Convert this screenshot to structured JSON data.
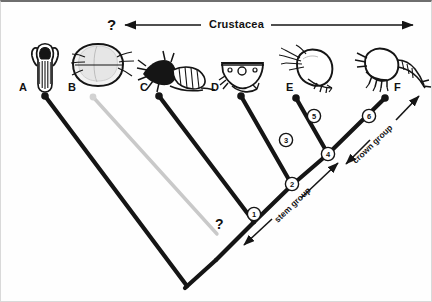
{
  "figure": {
    "title_label": "Crustacea",
    "uncertainty_marks": [
      {
        "id": "top-question",
        "text": "?"
      },
      {
        "id": "branch-b-question",
        "text": "?"
      }
    ],
    "group_labels": [
      {
        "id": "stem-group",
        "text": "stem group"
      },
      {
        "id": "crown-group",
        "text": "crown group"
      }
    ],
    "taxa": [
      {
        "letter": "A",
        "organism": "trilobite-like-arthropod"
      },
      {
        "letter": "B",
        "organism": "bivalved-ostracod"
      },
      {
        "letter": "C",
        "organism": "spiny-shrimp-larva"
      },
      {
        "letter": "D",
        "organism": "carapace-fragment"
      },
      {
        "letter": "E",
        "organism": "ostracod-with-antennae"
      },
      {
        "letter": "F",
        "organism": "copepod"
      }
    ],
    "nodes": [
      {
        "number": "1"
      },
      {
        "number": "2"
      },
      {
        "number": "3"
      },
      {
        "number": "4"
      },
      {
        "number": "5"
      },
      {
        "number": "6"
      }
    ],
    "colors": {
      "line": "#111111",
      "uncertain_line": "#c9c9c9",
      "background": "#fefefe",
      "text": "#111111"
    }
  }
}
